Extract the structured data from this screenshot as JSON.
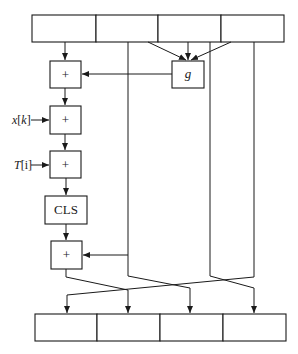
{
  "diagram": {
    "type": "block-diagram",
    "top_register": {
      "cells": [
        "",
        "",
        "",
        ""
      ]
    },
    "bottom_register": {
      "cells": [
        "",
        "",
        "",
        ""
      ]
    },
    "blocks": {
      "add1": "+",
      "add2": "+",
      "add3": "+",
      "cls": "CLS",
      "add4": "+",
      "g": "g"
    },
    "inputs": {
      "x_var": "x",
      "x_open": "[",
      "x_idx": "k",
      "x_close": "]",
      "t_var": "T",
      "t_rest": "[i]"
    },
    "colors": {
      "stroke": "#1a1a1a",
      "background": "#ffffff"
    }
  }
}
